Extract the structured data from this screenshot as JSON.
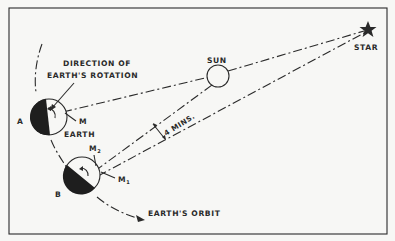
{
  "diagram": {
    "labels": {
      "direction": [
        "DIRECTION OF",
        "EARTH'S ROTATION"
      ],
      "sun": "SUN",
      "star": "STAR",
      "earth": "EARTH",
      "position_a": "A",
      "position_b": "B",
      "meridian": "M",
      "meridian_1": "M",
      "meridian_1_sub": "1",
      "meridian_2": "M",
      "meridian_2_sub": "2",
      "angle": "4 MINS.",
      "orbit": "EARTH'S ORBIT"
    },
    "colors": {
      "ink": "#2a2a2a",
      "paper": "#f7f7f5"
    }
  }
}
